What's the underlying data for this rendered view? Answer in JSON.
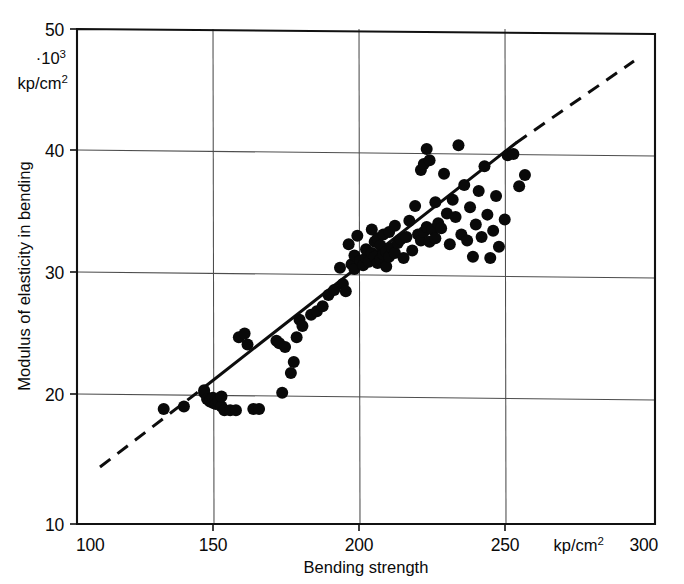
{
  "chart_data": {
    "type": "scatter",
    "title": "",
    "xlabel": "Bending strength",
    "ylabel": "Modulus of elasticity in bending",
    "x_unit": "kp/cm",
    "x_unit_sup": "2",
    "y_unit_prefix": "·10",
    "y_unit_prefix_sup": "3",
    "y_unit": "kp/cm",
    "y_unit_sup": "2",
    "xlim": [
      100,
      300
    ],
    "ylim": [
      10,
      50
    ],
    "xticks": [
      100,
      150,
      200,
      250,
      300
    ],
    "yticks": [
      10,
      20,
      30,
      40,
      50
    ],
    "xtick_labels": [
      "100",
      "150",
      "200",
      "250",
      "300"
    ],
    "ytick_labels": [
      "10",
      "20",
      "30",
      "40",
      "50"
    ],
    "grid": true,
    "legend": "none",
    "marker": "filled-circle",
    "marker_color": "#090909",
    "trendline": {
      "style": "solid-center-dashed-extrapolation",
      "solid_x": [
        143,
        251
      ],
      "solid_y": [
        19.6,
        39.9
      ],
      "dashed_low_x": [
        108,
        143
      ],
      "dashed_low_y": [
        13.1,
        19.6
      ],
      "dashed_high_x": [
        251,
        292
      ],
      "dashed_high_y": [
        39.9,
        47.4
      ]
    },
    "x": [
      130,
      137,
      144,
      144,
      145,
      146,
      146,
      147,
      147,
      148,
      148,
      149,
      149,
      150,
      150,
      151,
      153,
      155,
      156,
      158,
      159,
      161,
      163,
      169,
      170,
      171,
      172,
      174,
      175,
      176,
      177,
      178,
      181,
      183,
      185,
      187,
      189,
      191,
      192,
      193,
      194,
      195,
      196,
      196,
      197,
      198,
      199,
      200,
      200,
      201,
      202,
      202,
      203,
      203,
      204,
      204,
      205,
      205,
      206,
      206,
      207,
      207,
      208,
      208,
      209,
      210,
      210,
      211,
      212,
      213,
      214,
      215,
      216,
      217,
      218,
      219,
      219,
      220,
      220,
      221,
      221,
      222,
      222,
      223,
      224,
      224,
      225,
      226,
      227,
      228,
      229,
      230,
      231,
      232,
      233,
      234,
      235,
      236,
      237,
      238,
      239,
      240,
      241,
      242,
      243,
      244,
      245,
      246,
      248,
      249,
      251,
      253,
      255
    ],
    "y": [
      19.3,
      19.5,
      20.6,
      20.8,
      20.1,
      20.0,
      19.9,
      19.8,
      20.2,
      20.0,
      19.7,
      20.1,
      19.9,
      19.5,
      20.3,
      19.2,
      19.2,
      19.2,
      25.1,
      25.4,
      24.5,
      19.3,
      19.3,
      24.8,
      24.6,
      20.6,
      24.3,
      22.2,
      23.1,
      25.1,
      26.5,
      26.0,
      26.9,
      27.2,
      27.6,
      28.5,
      28.9,
      30.7,
      29.4,
      28.8,
      32.6,
      31.0,
      31.7,
      30.6,
      33.3,
      31.3,
      30.9,
      31.5,
      32.2,
      31.2,
      31.9,
      33.8,
      31.6,
      32.8,
      31.1,
      33.1,
      31.4,
      32.5,
      31.8,
      33.4,
      30.8,
      32.0,
      31.6,
      33.6,
      32.3,
      31.9,
      34.1,
      32.7,
      33.0,
      31.5,
      33.2,
      34.5,
      32.1,
      35.7,
      33.4,
      32.9,
      38.6,
      33.6,
      39.1,
      34.0,
      40.3,
      32.8,
      39.4,
      33.8,
      33.1,
      36.0,
      34.3,
      33.9,
      38.3,
      35.1,
      32.6,
      36.2,
      34.8,
      40.6,
      33.4,
      37.4,
      32.9,
      35.6,
      31.6,
      34.2,
      36.9,
      33.2,
      38.9,
      35.0,
      31.5,
      33.7,
      36.5,
      32.4,
      34.6,
      39.8,
      39.9,
      37.3,
      38.2
    ]
  }
}
